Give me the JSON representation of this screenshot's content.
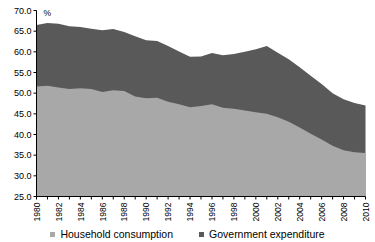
{
  "chart_data": {
    "type": "area",
    "stacked": true,
    "title": "",
    "xlabel": "",
    "ylabel": "",
    "unit_label": "%",
    "ylim": [
      25.0,
      70.0
    ],
    "ytick_step": 5.0,
    "ytick_labels": [
      "70.0",
      "65.0",
      "60.0",
      "55.0",
      "50.0",
      "45.0",
      "40.0",
      "35.0",
      "30.0",
      "25.0"
    ],
    "ytick_values": [
      70.0,
      65.0,
      60.0,
      55.0,
      50.0,
      45.0,
      40.0,
      35.0,
      30.0,
      25.0
    ],
    "grid": false,
    "legend_position": "bottom",
    "xlim": [
      1980,
      2010
    ],
    "x": [
      1980,
      1981,
      1982,
      1983,
      1984,
      1985,
      1986,
      1987,
      1988,
      1989,
      1990,
      1991,
      1992,
      1993,
      1994,
      1995,
      1996,
      1997,
      1998,
      1999,
      2000,
      2001,
      2002,
      2003,
      2004,
      2005,
      2006,
      2007,
      2008,
      2009,
      2010
    ],
    "xtick_labels": [
      "1980",
      "1982",
      "1984",
      "1986",
      "1988",
      "1990",
      "1992",
      "1994",
      "1996",
      "1998",
      "2000",
      "2002",
      "2004",
      "2006",
      "2008",
      "2010"
    ],
    "xtick_values": [
      1980,
      1982,
      1984,
      1986,
      1988,
      1990,
      1992,
      1994,
      1996,
      1998,
      2000,
      2002,
      2004,
      2006,
      2008,
      2010
    ],
    "series": [
      {
        "name": "Household consumption",
        "color": "#a8a8a8",
        "values": [
          51.6,
          51.8,
          51.4,
          51.0,
          51.2,
          51.0,
          50.3,
          50.7,
          50.5,
          49.2,
          48.8,
          48.9,
          47.9,
          47.3,
          46.6,
          46.9,
          47.3,
          46.5,
          46.2,
          45.8,
          45.4,
          45.0,
          44.2,
          43.1,
          41.7,
          40.2,
          38.8,
          37.3,
          36.2,
          35.7,
          35.5
        ]
      },
      {
        "name": "Government expenditure",
        "color": "#595959",
        "values": [
          14.9,
          15.2,
          15.4,
          15.2,
          14.8,
          14.6,
          14.9,
          14.8,
          14.3,
          14.6,
          14.0,
          13.7,
          13.5,
          12.8,
          12.2,
          12.0,
          12.4,
          12.7,
          13.3,
          14.2,
          15.2,
          16.4,
          15.6,
          15.1,
          14.6,
          14.0,
          13.4,
          12.7,
          12.3,
          11.9,
          11.5
        ]
      }
    ],
    "totals": [
      66.5,
      67.0,
      66.8,
      66.2,
      66.0,
      65.6,
      65.2,
      65.5,
      64.8,
      63.8,
      62.8,
      62.6,
      61.4,
      60.1,
      58.8,
      58.9,
      59.7,
      59.2,
      59.5,
      60.0,
      60.6,
      61.4,
      59.8,
      58.2,
      56.3,
      54.2,
      52.2,
      50.0,
      48.5,
      47.6,
      47.0
    ]
  },
  "legend": {
    "items": [
      {
        "label": "Household consumption",
        "color": "#a8a8a8"
      },
      {
        "label": "Government expenditure",
        "color": "#595959"
      }
    ]
  }
}
